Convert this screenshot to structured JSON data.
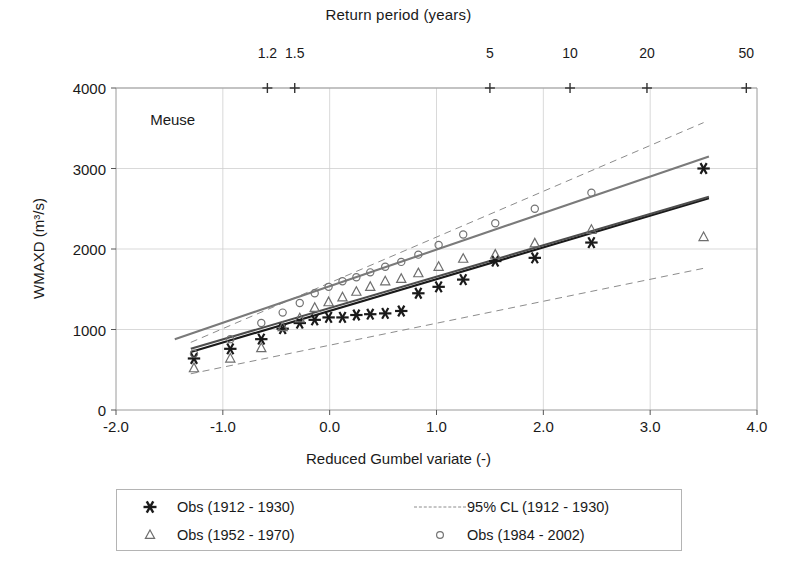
{
  "chart_data": {
    "type": "scatter",
    "title": "",
    "annotation": "Meuse",
    "xlabel": "Reduced Gumbel variate (-)",
    "ylabel": "WMAXD (m3/s)",
    "ylabel_display": "WMAXD (m³/s)",
    "xlim": [
      -2.0,
      4.0
    ],
    "ylim": [
      0,
      4000
    ],
    "xticks": [
      "-2.0",
      "-1.0",
      "0.0",
      "1.0",
      "2.0",
      "3.0",
      "4.0"
    ],
    "xtick_values": [
      -2.0,
      -1.0,
      0.0,
      1.0,
      2.0,
      3.0,
      4.0
    ],
    "yticks": [
      "0",
      "1000",
      "2000",
      "3000",
      "4000"
    ],
    "ytick_values": [
      0,
      1000,
      2000,
      3000,
      4000
    ],
    "grid": true,
    "secondary_axis": {
      "title": "Return period (years)",
      "position": "top",
      "ticks": [
        "1.2",
        "1.5",
        "5",
        "10",
        "20",
        "50"
      ],
      "tick_x_values": [
        -0.583,
        -0.327,
        1.5,
        2.25,
        2.97,
        3.9
      ],
      "marker": "plus"
    },
    "legend_position": "below-plot",
    "series": [
      {
        "name": "Obs (1912 - 1930)",
        "marker": "asterisk",
        "color": "#1a1a1a",
        "points": [
          [
            -1.27,
            640
          ],
          [
            -0.93,
            760
          ],
          [
            -0.64,
            880
          ],
          [
            -0.44,
            1010
          ],
          [
            -0.28,
            1080
          ],
          [
            -0.14,
            1120
          ],
          [
            -0.01,
            1150
          ],
          [
            0.12,
            1150
          ],
          [
            0.25,
            1180
          ],
          [
            0.38,
            1190
          ],
          [
            0.52,
            1200
          ],
          [
            0.67,
            1230
          ],
          [
            0.83,
            1450
          ],
          [
            1.02,
            1530
          ],
          [
            1.25,
            1620
          ],
          [
            1.55,
            1850
          ],
          [
            1.92,
            1890
          ],
          [
            2.45,
            2080
          ],
          [
            3.5,
            3000
          ]
        ]
      },
      {
        "name": "Obs (1952 - 1970)",
        "marker": "triangle",
        "color": "#6e6e6e",
        "points": [
          [
            -1.27,
            520
          ],
          [
            -0.93,
            640
          ],
          [
            -0.64,
            770
          ],
          [
            -0.44,
            1030
          ],
          [
            -0.28,
            1140
          ],
          [
            -0.14,
            1270
          ],
          [
            -0.01,
            1340
          ],
          [
            0.12,
            1400
          ],
          [
            0.25,
            1470
          ],
          [
            0.38,
            1530
          ],
          [
            0.52,
            1600
          ],
          [
            0.67,
            1630
          ],
          [
            0.83,
            1700
          ],
          [
            1.02,
            1780
          ],
          [
            1.25,
            1880
          ],
          [
            1.55,
            1930
          ],
          [
            1.92,
            2070
          ],
          [
            2.45,
            2240
          ],
          [
            3.5,
            2150
          ]
        ]
      },
      {
        "name": "Obs (1984 - 2002)",
        "marker": "circle",
        "color": "#737373",
        "points": [
          [
            -1.27,
            700
          ],
          [
            -0.93,
            880
          ],
          [
            -0.64,
            1080
          ],
          [
            -0.44,
            1210
          ],
          [
            -0.28,
            1330
          ],
          [
            -0.14,
            1450
          ],
          [
            -0.01,
            1530
          ],
          [
            0.12,
            1600
          ],
          [
            0.25,
            1650
          ],
          [
            0.38,
            1710
          ],
          [
            0.52,
            1780
          ],
          [
            0.67,
            1840
          ],
          [
            0.83,
            1930
          ],
          [
            1.02,
            2050
          ],
          [
            1.25,
            2180
          ],
          [
            1.55,
            2320
          ],
          [
            1.92,
            2500
          ],
          [
            2.45,
            2700
          ]
        ]
      }
    ],
    "fitted_lines": [
      {
        "name": "Fit (1912 - 1930)",
        "color": "#1a1a1a",
        "style": "solid",
        "x": [
          -1.3,
          3.55
        ],
        "y": [
          720,
          2630
        ]
      },
      {
        "name": "Fit (1952 - 1970)",
        "color": "#4d4d4d",
        "style": "solid",
        "x": [
          -1.3,
          3.55
        ],
        "y": [
          760,
          2650
        ]
      },
      {
        "name": "Fit (1984 - 2002)",
        "color": "#7a7a7a",
        "style": "solid",
        "x": [
          -1.45,
          3.55
        ],
        "y": [
          880,
          3150
        ]
      }
    ],
    "confidence_bands": [
      {
        "name": "95% CL (1912 - 1930)",
        "color": "#8c8c8c",
        "style": "dashed",
        "bound": "upper",
        "x": [
          -1.3,
          3.5
        ],
        "y": [
          840,
          3570
        ]
      },
      {
        "name": "95% CL (1912 - 1930)",
        "color": "#8c8c8c",
        "style": "dashed",
        "bound": "lower",
        "x": [
          -1.3,
          3.5
        ],
        "y": [
          450,
          1760
        ]
      }
    ]
  },
  "legend": {
    "entries": [
      {
        "label": "Obs (1912 - 1930)",
        "marker": "asterisk",
        "color": "#1a1a1a"
      },
      {
        "label": "95% CL (1912 - 1930)",
        "marker": "dashed-line",
        "color": "#8c8c8c"
      },
      {
        "label": "Obs (1952 - 1970)",
        "marker": "triangle",
        "color": "#6e6e6e"
      },
      {
        "label": "Obs (1984 - 2002)",
        "marker": "circle",
        "color": "#737373"
      }
    ]
  },
  "style": {
    "axis_color": "#9a9a9a",
    "grid_color": "#cfcfcf",
    "text_color": "#1a1a1a",
    "background": "#ffffff"
  }
}
